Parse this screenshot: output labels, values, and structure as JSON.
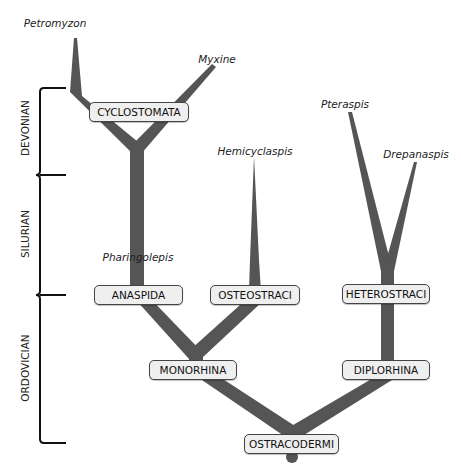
{
  "diagram": {
    "branch_color": "#555555",
    "periods": [
      {
        "label": "DEVONIAN"
      },
      {
        "label": "SILURIAN"
      },
      {
        "label": "ORDOVICIAN"
      }
    ],
    "taxa": {
      "petromyzon": "Petromyzon",
      "myxine": "Myxine",
      "hemicyclaspis": "Hemicyclaspis",
      "pteraspis": "Pteraspis",
      "drepanaspis": "Drepanaspis",
      "pharingolepis": "Pharingolepis"
    },
    "nodes": {
      "cyclostomata": "CYCLOSTOMATA",
      "anaspida": "ANASPIDA",
      "osteostraci": "OSTEOSTRACI",
      "heterostraci": "HETEROSTRACI",
      "monorhina": "MONORHINA",
      "diplorhina": "DIPLORHINA",
      "ostracodermi": "OSTRACODERMI"
    }
  }
}
